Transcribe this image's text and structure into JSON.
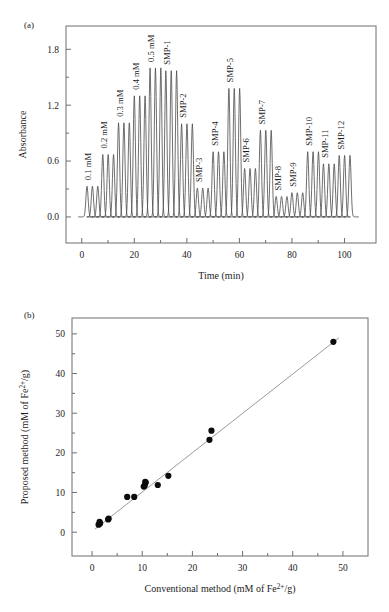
{
  "figure": {
    "panel_a_label": "(a)",
    "panel_b_label": "(b)"
  },
  "chart_data": [
    {
      "id": "chromatogram",
      "type": "line",
      "title": "",
      "xlabel": "Time (min)",
      "ylabel": "Absorbance",
      "xlim": [
        -6,
        112
      ],
      "ylim": [
        -0.28,
        2.05
      ],
      "xticks": [
        0,
        20,
        40,
        60,
        80,
        100
      ],
      "xtick_labels": [
        "0",
        "20",
        "40",
        "60",
        "80",
        "100"
      ],
      "x_minor_ticks": [
        10,
        30,
        50,
        70,
        90
      ],
      "yticks": [
        0.0,
        0.6,
        1.2,
        1.8
      ],
      "ytick_labels": [
        "0.0",
        "0.6",
        "1.2",
        "1.8"
      ],
      "y_minor_ticks": [
        0.3,
        0.9,
        1.5
      ],
      "grid": false,
      "legend": "none",
      "peak_width_min": 1.05,
      "peak_spacing_min": 2.05,
      "group_gap_min": 1.5,
      "series_note": "Flow-injection chromatogram; each labelled group contains 3 replicate peaks of equal height.",
      "groups": [
        {
          "label": "0.1 mM",
          "start_time": 2.0,
          "n_peaks": 3,
          "height": 0.33
        },
        {
          "label": "0.2 mM",
          "start_time": 8.0,
          "n_peaks": 3,
          "height": 0.67
        },
        {
          "label": "0.3 mM",
          "start_time": 14.0,
          "n_peaks": 3,
          "height": 1.01
        },
        {
          "label": "0.4 mM",
          "start_time": 20.0,
          "n_peaks": 3,
          "height": 1.3
        },
        {
          "label": "0.5 mM",
          "start_time": 26.0,
          "n_peaks": 3,
          "height": 1.6
        },
        {
          "label": "SMP-1",
          "start_time": 32.0,
          "n_peaks": 3,
          "height": 1.57
        },
        {
          "label": "SMP-2",
          "start_time": 38.0,
          "n_peaks": 3,
          "height": 1.0
        },
        {
          "label": "SMP-3",
          "start_time": 44.0,
          "n_peaks": 3,
          "height": 0.31
        },
        {
          "label": "SMP-4",
          "start_time": 50.0,
          "n_peaks": 3,
          "height": 0.7
        },
        {
          "label": "SMP-5",
          "start_time": 56.0,
          "n_peaks": 3,
          "height": 1.38
        },
        {
          "label": "SMP-6",
          "start_time": 62.0,
          "n_peaks": 3,
          "height": 0.52
        },
        {
          "label": "SMP-7",
          "start_time": 68.0,
          "n_peaks": 3,
          "height": 0.93
        },
        {
          "label": "SMP-8",
          "start_time": 74.0,
          "n_peaks": 3,
          "height": 0.22
        },
        {
          "label": "SMP-9",
          "start_time": 80.0,
          "n_peaks": 3,
          "height": 0.26
        },
        {
          "label": "SMP-10",
          "start_time": 86.0,
          "n_peaks": 3,
          "height": 0.7
        },
        {
          "label": "SMP-11",
          "start_time": 92.0,
          "n_peaks": 3,
          "height": 0.57
        },
        {
          "label": "SMP-12",
          "start_time": 98.0,
          "n_peaks": 3,
          "height": 0.66
        }
      ]
    },
    {
      "id": "method-comparison",
      "type": "scatter",
      "title": "",
      "xlabel_parts": {
        "pre": "Conventional method (mM of Fe",
        "sup": "2+",
        "post": "/g)"
      },
      "ylabel_parts": {
        "pre": "Proposed method (mM of Fe",
        "sup": "2+",
        "post": "/g)"
      },
      "xlim": [
        -4,
        55
      ],
      "ylim": [
        -6,
        54
      ],
      "xticks": [
        0,
        10,
        20,
        30,
        40,
        50
      ],
      "xtick_labels": [
        "0",
        "10",
        "20",
        "30",
        "40",
        "50"
      ],
      "x_minor_ticks": [
        5,
        15,
        25,
        35,
        45
      ],
      "yticks": [
        0,
        10,
        20,
        30,
        40,
        50
      ],
      "ytick_labels": [
        "0",
        "10",
        "20",
        "30",
        "40",
        "50"
      ],
      "y_minor_ticks": [
        5,
        15,
        25,
        35,
        45
      ],
      "grid": false,
      "legend": "none",
      "points": [
        {
          "x": 1.3,
          "y": 1.9
        },
        {
          "x": 1.6,
          "y": 2.2
        },
        {
          "x": 1.5,
          "y": 2.6
        },
        {
          "x": 3.2,
          "y": 3.2
        },
        {
          "x": 3.3,
          "y": 3.4
        },
        {
          "x": 7.0,
          "y": 8.9
        },
        {
          "x": 8.4,
          "y": 8.9
        },
        {
          "x": 10.3,
          "y": 11.5
        },
        {
          "x": 10.5,
          "y": 11.8
        },
        {
          "x": 10.7,
          "y": 12.5
        },
        {
          "x": 10.6,
          "y": 12.7
        },
        {
          "x": 13.1,
          "y": 11.9
        },
        {
          "x": 15.2,
          "y": 14.2
        },
        {
          "x": 23.4,
          "y": 23.3
        },
        {
          "x": 23.8,
          "y": 25.6
        },
        {
          "x": 48.1,
          "y": 48.0
        }
      ],
      "fit_line": {
        "x1": 0.6,
        "y1": 0.8,
        "x2": 49.2,
        "y2": 49.0
      }
    }
  ]
}
